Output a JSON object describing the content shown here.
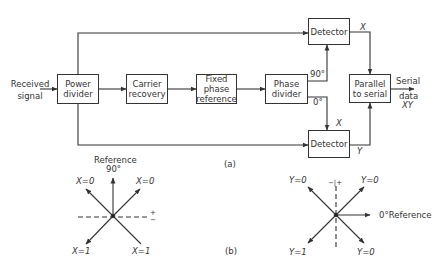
{
  "figure": {
    "part_a_label": "(a)",
    "part_b_label": "(b)",
    "line_color": "#333333"
  },
  "blocks": {
    "power_divider": "Power divider",
    "carrier_recovery": "Carrier recovery",
    "fixed_phase_reference": "Fixed phase reference",
    "phase_divider": "Phase divider",
    "detector_top": "Detector",
    "detector_bottom": "Detector",
    "parallel_to_serial": "Parallel to serial"
  },
  "signals": {
    "input": "Received signal",
    "output_line1": "Serial",
    "output_line2": "data",
    "output_line3": "XY",
    "phase_90": "90°",
    "phase_0": "0°",
    "x_top": "X",
    "x_mid": "X",
    "y_bottom": "Y"
  },
  "phasor_x": {
    "reference_line1": "Reference",
    "reference_line2": "90°",
    "upper_left": "X=0",
    "upper_right": "X=0",
    "lower_left": "X=1",
    "lower_right": "X=1",
    "plus": "+",
    "minus": "−"
  },
  "phasor_y": {
    "reference": "0°Reference",
    "upper_left": "Y=0",
    "upper_right": "Y=0",
    "lower_left": "Y=1",
    "lower_right": "Y=0",
    "minus_plus": "−|+"
  }
}
